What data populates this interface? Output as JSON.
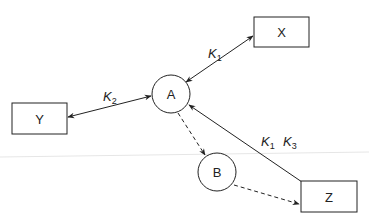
{
  "diagram": {
    "nodes": [
      {
        "id": "X",
        "label": "X",
        "shape": "rectangle"
      },
      {
        "id": "Y",
        "label": "Y",
        "shape": "rectangle"
      },
      {
        "id": "Z",
        "label": "Z",
        "shape": "rectangle"
      },
      {
        "id": "A",
        "label": "A",
        "shape": "circle"
      },
      {
        "id": "B",
        "label": "B",
        "shape": "circle"
      }
    ],
    "edges": [
      {
        "from": "A",
        "to": "X",
        "style": "solid",
        "direction": "both",
        "label": "K1",
        "label_main": "K",
        "label_sub": "1"
      },
      {
        "from": "A",
        "to": "Y",
        "style": "solid",
        "direction": "both",
        "label": "K2",
        "label_main": "K",
        "label_sub": "2"
      },
      {
        "from": "Z",
        "to": "A",
        "style": "solid",
        "direction": "forward",
        "label": "K1 K3",
        "labels": [
          {
            "main": "K",
            "sub": "1"
          },
          {
            "main": "K",
            "sub": "3"
          }
        ]
      },
      {
        "from": "A",
        "to": "B",
        "style": "dashed",
        "direction": "forward"
      },
      {
        "from": "B",
        "to": "Z",
        "style": "dashed",
        "direction": "forward"
      }
    ]
  }
}
